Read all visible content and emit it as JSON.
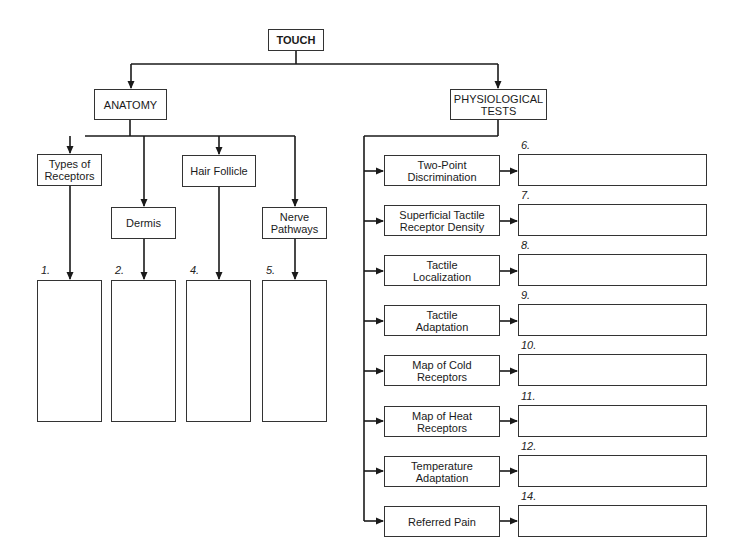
{
  "root": {
    "label": "TOUCH"
  },
  "branches": {
    "anatomy": {
      "label": "ANATOMY",
      "topics": [
        {
          "label": [
            "Types of",
            "Receptors"
          ],
          "answer_number": "1."
        },
        {
          "label": [
            "Dermis"
          ],
          "answer_number": "2."
        },
        {
          "label": [
            "Hair Follicle"
          ],
          "answer_number": "4."
        },
        {
          "label": [
            "Nerve",
            "Pathways"
          ],
          "answer_number": "5."
        }
      ]
    },
    "physiological_tests": {
      "label": [
        "PHYSIOLOGICAL",
        "TESTS"
      ],
      "tests": [
        {
          "label": [
            "Two-Point",
            "Discrimination"
          ],
          "answer_number": "6."
        },
        {
          "label": [
            "Superficial Tactile",
            "Receptor Density"
          ],
          "answer_number": "7."
        },
        {
          "label": [
            "Tactile",
            "Localization"
          ],
          "answer_number": "8."
        },
        {
          "label": [
            "Tactile",
            "Adaptation"
          ],
          "answer_number": "9."
        },
        {
          "label": [
            "Map of Cold",
            "Receptors"
          ],
          "answer_number": "10."
        },
        {
          "label": [
            "Map of Heat",
            "Receptors"
          ],
          "answer_number": "11."
        },
        {
          "label": [
            "Temperature",
            "Adaptation"
          ],
          "answer_number": "12."
        },
        {
          "label": [
            "Referred Pain"
          ],
          "answer_number": "14."
        }
      ]
    }
  },
  "colors": {
    "line": "#1a1a1a",
    "border": "#333333",
    "background": "#ffffff"
  }
}
